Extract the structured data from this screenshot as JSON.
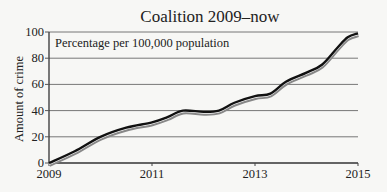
{
  "chart_data": {
    "type": "line",
    "title": "Coalition 2009–now",
    "annotation": "Percentage per 100,000 population",
    "xlabel": "",
    "ylabel": "Amount of crime",
    "xlim": [
      2009,
      2015
    ],
    "ylim": [
      0,
      100
    ],
    "x_ticks": [
      "2009",
      "2011",
      "2013",
      "2015"
    ],
    "y_ticks": [
      "0",
      "20",
      "40",
      "60",
      "80",
      "100"
    ],
    "grid": "horizontal",
    "legend": null,
    "series": [
      {
        "name": "Amount of crime",
        "color": "#111111",
        "shadow_color": "#888888",
        "x": [
          2009.0,
          2009.5,
          2010.0,
          2010.5,
          2011.0,
          2011.3,
          2011.6,
          2012.0,
          2012.3,
          2012.6,
          2013.0,
          2013.3,
          2013.6,
          2014.0,
          2014.3,
          2014.6,
          2014.8,
          2015.0
        ],
        "values": [
          0,
          9,
          20,
          27,
          31,
          35,
          40,
          39,
          40,
          46,
          51,
          53,
          62,
          69,
          75,
          88,
          96,
          99
        ]
      }
    ]
  }
}
